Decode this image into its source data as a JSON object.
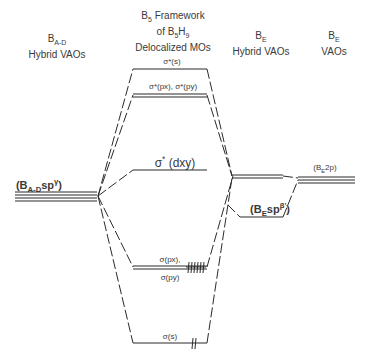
{
  "headers": {
    "bad": {
      "line1_main": "B",
      "line1_sub": "A-D",
      "line2": "Hybrid VAOs"
    },
    "framework": {
      "line1_main": "B",
      "line1_sub": "5",
      "line1_rest": " Framework",
      "line2_pre": "of B",
      "line2_sub1": "5",
      "line2_mid": "H",
      "line2_sub2": "9",
      "line3": "Delocalized MOs"
    },
    "be_hybrid": {
      "line1_main": "B",
      "line1_sub": "E",
      "line2": "Hybrid VAOs"
    },
    "be_vaos": {
      "line1_main": "B",
      "line1_sub": "E",
      "line2": "VAOs"
    }
  },
  "levels": {
    "sigma_star_s": "σ*(s)",
    "sigma_star_pxpy": "σ*(px), σ*(py)",
    "sigma_star_dxy_main": "σ",
    "sigma_star_dxy_sup": "*",
    "sigma_star_dxy_rest": " (dxy)",
    "sigma_px": "σ(px),",
    "sigma_py": "σ(py)",
    "sigma_s": "σ(s)"
  },
  "left_label": {
    "open": "(B",
    "sub": "A-D",
    "mid": "sp",
    "sup": "γ",
    "close": ")"
  },
  "be_sp_label": {
    "open": "(B",
    "sub": "E",
    "mid": "sp",
    "sup": "β'",
    "close": ")"
  },
  "be_2p_label": {
    "open": "(B",
    "sub": "E",
    "mid": "2p",
    "close": ")"
  },
  "colors": {
    "line": "#2a2a2a",
    "text": "#3a3a3a"
  }
}
